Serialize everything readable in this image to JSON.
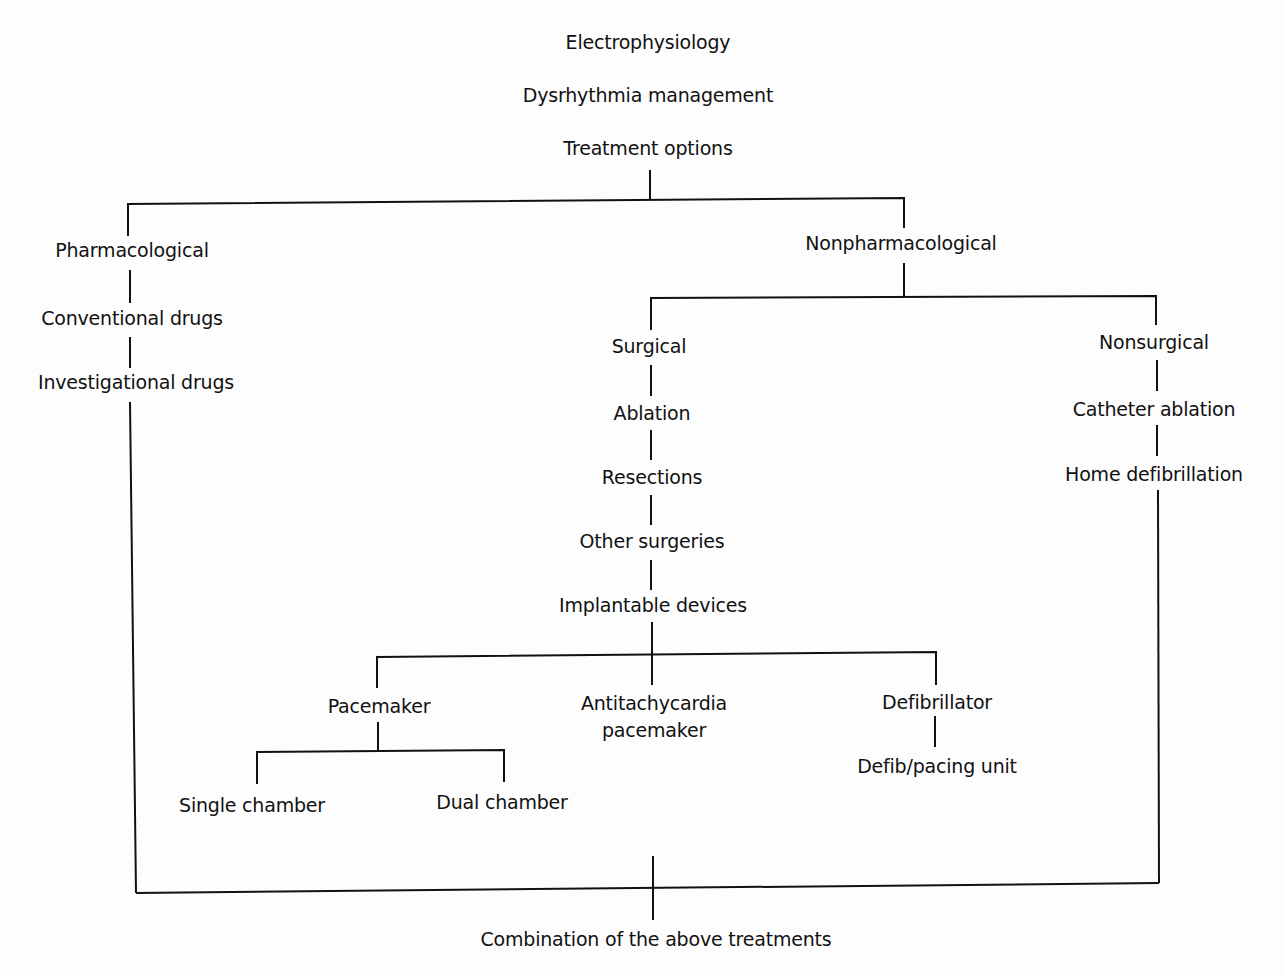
{
  "diagram": {
    "title_lines": [
      "Electrophysiology",
      "Dysrhythmia management",
      "Treatment options"
    ],
    "nodes": {
      "pharmacological": "Pharmacological",
      "conventional_drugs": "Conventional drugs",
      "investigational_drugs": "Investigational drugs",
      "nonpharmacological": "Nonpharmacological",
      "surgical": "Surgical",
      "ablation": "Ablation",
      "resections": "Resections",
      "other_surgeries": "Other surgeries",
      "implantable_devices": "Implantable devices",
      "pacemaker": "Pacemaker",
      "antitachycardia_1": "Antitachycardia",
      "antitachycardia_2": "pacemaker",
      "defibrillator": "Defibrillator",
      "defib_pacing_unit": "Defib/pacing unit",
      "single_chamber": "Single chamber",
      "dual_chamber": "Dual chamber",
      "nonsurgical": "Nonsurgical",
      "catheter_ablation": "Catheter ablation",
      "home_defibrillation": "Home defibrillation",
      "combination": "Combination of the above treatments"
    }
  }
}
